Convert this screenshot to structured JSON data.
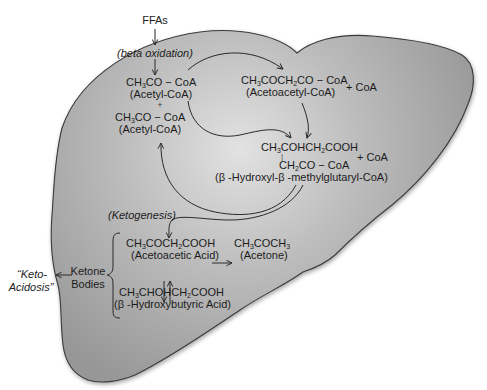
{
  "diagram": {
    "colors": {
      "liver_fill_light": "#dcdcdc",
      "liver_fill_dark": "#9a9a9a",
      "outline": "#3a3a3a",
      "text": "#1c1c1c"
    },
    "inputs": {
      "ffas": "FFAs",
      "beta_oxidation": "(beta oxidation)"
    },
    "acetyl_coa_1": {
      "formula_a": "CH",
      "formula_sub": "3",
      "formula_b": "CO − CoA",
      "name": "(Acetyl-CoA)"
    },
    "plus_sign": "+",
    "acetyl_coa_2": {
      "formula_a": "CH",
      "formula_sub": "3",
      "formula_b": "CO − CoA",
      "name": "(Acetyl-CoA)"
    },
    "acetoacetyl_coa": {
      "formula_parts": [
        "CH",
        "3",
        "COCH",
        "2",
        "CO − CoA"
      ],
      "name": "(Acetoacetyl-CoA)",
      "byproduct": "+ CoA"
    },
    "hmg_coa": {
      "line1_parts": [
        "CH",
        "3",
        "COHCH",
        "2",
        "COOH"
      ],
      "branch": "|",
      "line2_parts": [
        "CH",
        "2",
        "CO − CoA"
      ],
      "name": "(β -Hydroxyl-β -methylglutaryl-CoA)",
      "byproduct": "+ CoA"
    },
    "ketogenesis_label": "(Ketogenesis)",
    "acetoacetic_acid": {
      "formula_parts": [
        "CH",
        "3",
        "COCH",
        "2",
        "COOH"
      ],
      "name": "(Acetoacetic Acid)"
    },
    "acetone": {
      "formula_parts": [
        "CH",
        "3",
        "COCH",
        "3"
      ],
      "name": "(Acetone)"
    },
    "hydroxybutyric_acid": {
      "formula_parts": [
        "CH",
        "3",
        "CHOHCH",
        "2",
        "COOH"
      ],
      "name": "(β -Hydroxybutyric Acid)"
    },
    "ketone_bodies_label": {
      "line1": "Ketone",
      "line2": "Bodies"
    },
    "ketoacidosis_label": {
      "line1": "“Keto-",
      "line2": "Acidosis”"
    },
    "arrows": [
      {
        "name": "ffa-to-beta-oxidation",
        "type": "straight-down"
      },
      {
        "name": "beta-oxidation-to-acetyl-coa",
        "type": "straight-down"
      },
      {
        "name": "acetyl-coa-to-acetoacetyl-coa",
        "type": "curved"
      },
      {
        "name": "acetoacetyl-coa-to-hmg-coa",
        "type": "curved-down"
      },
      {
        "name": "acetyl-coa-to-hmg-coa",
        "type": "curved"
      },
      {
        "name": "hmg-coa-to-acetyl-coa",
        "type": "curved-loop"
      },
      {
        "name": "hmg-coa-to-acetoacetic-acid",
        "type": "curved-down"
      },
      {
        "name": "acetoacetic-to-acetone",
        "type": "straight-right"
      },
      {
        "name": "acetoacetic-hydroxybutyric-equilibrium",
        "type": "double-vertical"
      },
      {
        "name": "ketone-bodies-to-ketoacidosis",
        "type": "straight-left"
      }
    ]
  }
}
